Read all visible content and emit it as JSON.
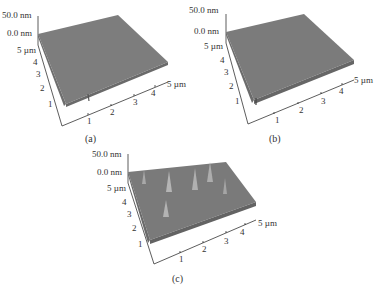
{
  "figure": {
    "panels": [
      {
        "id": "a",
        "caption": "(a)",
        "z_top": "50.0 nm",
        "z_zero": "0.0 nm",
        "y_axis_label": "5 µm",
        "y_ticks": [
          "4",
          "3",
          "2",
          "1"
        ],
        "x_axis_label": "5 µm",
        "x_ticks": [
          "1",
          "2",
          "3",
          "4"
        ],
        "surface_color": "#7a7a7a",
        "roughness": "low"
      },
      {
        "id": "b",
        "caption": "(b)",
        "z_top": "50.0 nm",
        "z_zero": "0.0 nm",
        "y_axis_label": "5 µm",
        "y_ticks": [
          "4",
          "3",
          "2",
          "1"
        ],
        "x_axis_label": "5 µm",
        "x_ticks": [
          "1",
          "2",
          "3",
          "4"
        ],
        "surface_color": "#7a7a7a",
        "roughness": "low-medium"
      },
      {
        "id": "c",
        "caption": "(c)",
        "z_top": "50.0 nm",
        "z_zero": "0.0 nm",
        "y_axis_label": "5 µm",
        "y_ticks": [
          "4",
          "3",
          "2",
          "1"
        ],
        "x_axis_label": "5 µm",
        "x_ticks": [
          "1",
          "2",
          "3",
          "4"
        ],
        "surface_color": "#7a7a7a",
        "roughness": "high"
      }
    ]
  }
}
